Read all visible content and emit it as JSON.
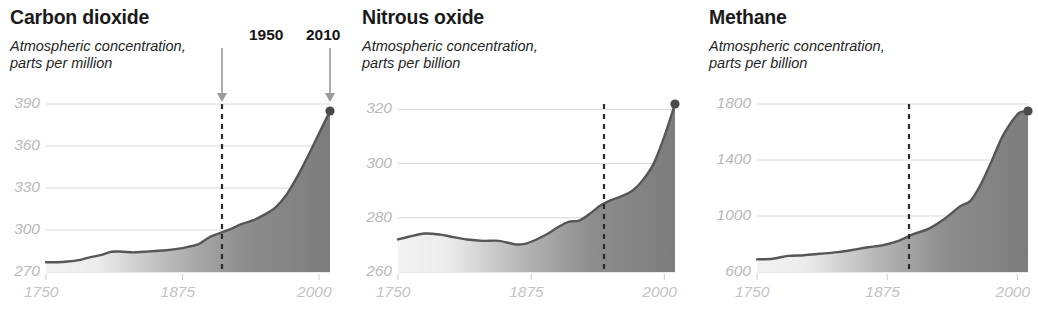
{
  "figure": {
    "background": "#ffffff",
    "gridline_color": "#d8d8d8",
    "curve_color": "#565656",
    "fill_color": "#7a7a7a",
    "axis_text_color": "#bdbdbd",
    "annotation_color": "#141414"
  },
  "annotations": {
    "year_1950_label": "1950",
    "year_2010_label": "2010",
    "arrow_icon_name": "down-arrow-icon"
  },
  "charts": [
    {
      "id": "carbon-dioxide",
      "title": "Carbon dioxide",
      "subtitle": "Atmospheric concentration,\nparts per million",
      "unit": "parts per million",
      "chart_data": {
        "type": "area",
        "title": "Carbon dioxide",
        "xlabel": "",
        "ylabel": "parts per million",
        "xlim": [
          1750,
          2010
        ],
        "ylim": [
          270,
          390
        ],
        "xticks": [
          1750,
          1875,
          2000
        ],
        "xtick_labels": [
          "1750",
          "1875",
          "2000"
        ],
        "yticks": [
          270,
          300,
          330,
          360,
          390
        ],
        "ytick_labels": [
          "270",
          "300",
          "330",
          "360",
          "390"
        ],
        "grid": true,
        "legend": "none",
        "marker_year": 2010,
        "marker_value": 385,
        "dashed_line_year": 1950,
        "x": [
          1750,
          1760,
          1770,
          1780,
          1790,
          1800,
          1810,
          1820,
          1830,
          1840,
          1850,
          1860,
          1870,
          1880,
          1890,
          1900,
          1910,
          1920,
          1930,
          1940,
          1950,
          1960,
          1970,
          1980,
          1990,
          2000,
          2010
        ],
        "y": [
          277,
          277,
          277.5,
          278.5,
          280.5,
          282,
          284.5,
          284.5,
          284,
          284.5,
          285,
          285.5,
          286.5,
          288,
          290,
          295,
          298,
          301,
          304.5,
          307,
          311,
          316,
          325,
          338,
          353,
          369,
          385
        ]
      }
    },
    {
      "id": "nitrous-oxide",
      "title": "Nitrous oxide",
      "subtitle": "Atmospheric concentration,\nparts per billion",
      "unit": "parts per billion",
      "chart_data": {
        "type": "area",
        "title": "Nitrous oxide",
        "xlabel": "",
        "ylabel": "parts per billion",
        "xlim": [
          1750,
          2010
        ],
        "ylim": [
          260,
          322
        ],
        "xticks": [
          1750,
          1875,
          2000
        ],
        "xtick_labels": [
          "1750",
          "1875",
          "2000"
        ],
        "yticks": [
          260,
          280,
          300,
          320
        ],
        "ytick_labels": [
          "260",
          "280",
          "300",
          "320"
        ],
        "grid": true,
        "legend": "none",
        "marker_year": 2010,
        "marker_value": 322,
        "dashed_line_year": 1943,
        "x": [
          1750,
          1760,
          1775,
          1790,
          1800,
          1815,
          1830,
          1845,
          1860,
          1870,
          1880,
          1890,
          1900,
          1910,
          1920,
          1930,
          1940,
          1950,
          1960,
          1970,
          1980,
          1990,
          2000,
          2010
        ],
        "y": [
          272,
          273,
          274.2,
          273.8,
          273,
          272,
          271.5,
          271.5,
          270.2,
          270.5,
          272,
          274,
          276.5,
          278.5,
          279,
          281.5,
          284.5,
          286.5,
          288,
          290,
          294,
          300,
          310,
          322
        ]
      }
    },
    {
      "id": "methane",
      "title": "Methane",
      "subtitle": "Atmospheric concentration,\nparts per billion",
      "unit": "parts per billion",
      "chart_data": {
        "type": "area",
        "title": "Methane",
        "xlabel": "",
        "ylabel": "parts per billion",
        "xlim": [
          1750,
          2010
        ],
        "ylim": [
          600,
          1800
        ],
        "xticks": [
          1750,
          1875,
          2000
        ],
        "xtick_labels": [
          "1750",
          "1875",
          "2000"
        ],
        "yticks": [
          600,
          1000,
          1400,
          1800
        ],
        "ytick_labels": [
          "600",
          "1000",
          "1400",
          "1800"
        ],
        "grid": true,
        "legend": "none",
        "marker_year": 2010,
        "marker_value": 1750,
        "dashed_line_year": 1953,
        "x": [
          1750,
          1765,
          1780,
          1795,
          1810,
          1825,
          1840,
          1855,
          1870,
          1885,
          1900,
          1915,
          1930,
          1945,
          1955,
          1965,
          1975,
          1985,
          1995,
          2002,
          2010
        ],
        "y": [
          690,
          695,
          715,
          720,
          730,
          740,
          755,
          775,
          790,
          820,
          870,
          910,
          980,
          1070,
          1110,
          1230,
          1390,
          1560,
          1680,
          1740,
          1750
        ]
      }
    }
  ]
}
